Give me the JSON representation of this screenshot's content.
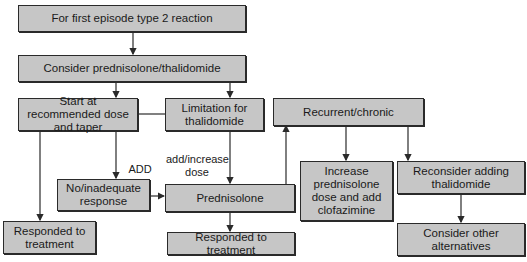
{
  "diagram": {
    "nodes": {
      "first_episode": "For first episode type 2 reaction",
      "consider": "Consider prednisolone/thalidomide",
      "start_dose": "Start at recommended dose and taper",
      "limitation": "Limitation for thalidomide",
      "recurrent": "Recurrent/chronic",
      "no_response": "No/inadequate response",
      "prednisolone": "Prednisolone",
      "increase": "Increase prednisolone dose and add clofazimine",
      "reconsider": "Reconsider adding thalidomide",
      "responded_left": "Responded to treatment",
      "responded_mid": "Responded to treatment",
      "other_alternatives": "Consider other alternatives"
    },
    "edge_labels": {
      "add": "ADD",
      "add_increase": "add/increase dose"
    },
    "colors": {
      "box_fill": "#c6c6c6",
      "border": "#2a2a2a"
    }
  }
}
